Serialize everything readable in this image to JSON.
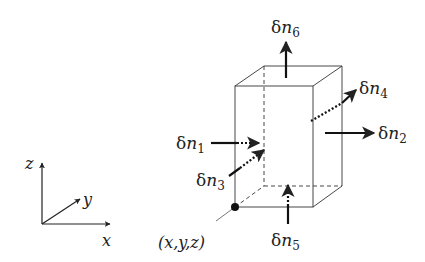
{
  "diagram": {
    "colors": {
      "ink": "#222222",
      "background": "#ffffff"
    },
    "axes": {
      "x_label": "x",
      "y_label": "y",
      "z_label": "z"
    },
    "corner_label": "(x,y,z)",
    "flux_labels": {
      "n1": {
        "prefix": "δ",
        "var": "n",
        "sub": "1"
      },
      "n2": {
        "prefix": "δ",
        "var": "n",
        "sub": "2"
      },
      "n3": {
        "prefix": "δ",
        "var": "n",
        "sub": "3"
      },
      "n4": {
        "prefix": "δ",
        "var": "n",
        "sub": "4"
      },
      "n5": {
        "prefix": "δ",
        "var": "n",
        "sub": "5"
      },
      "n6": {
        "prefix": "δ",
        "var": "n",
        "sub": "6"
      }
    }
  }
}
